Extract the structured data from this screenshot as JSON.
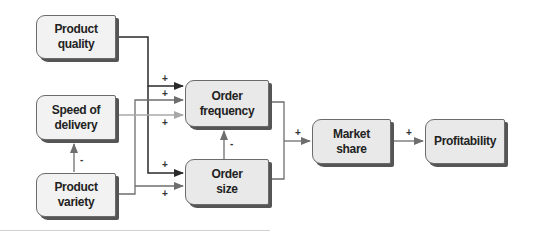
{
  "diagram": {
    "type": "causal-flow",
    "nodes": [
      {
        "id": "product_quality",
        "label": "Product\nquality"
      },
      {
        "id": "speed_of_delivery",
        "label": "Speed of\ndelivery"
      },
      {
        "id": "product_variety",
        "label": "Product\nvariety"
      },
      {
        "id": "order_frequency",
        "label": "Order\nfrequency"
      },
      {
        "id": "order_size",
        "label": "Order\nsize"
      },
      {
        "id": "market_share",
        "label": "Market\nshare"
      },
      {
        "id": "profitability",
        "label": "Profitability"
      }
    ],
    "edges": [
      {
        "from": "product_quality",
        "to": "order_frequency",
        "sign": "+"
      },
      {
        "from": "product_quality",
        "to": "order_size",
        "sign": "+"
      },
      {
        "from": "product_variety",
        "to": "order_frequency",
        "sign": "+"
      },
      {
        "from": "speed_of_delivery",
        "to": "order_frequency",
        "sign": "+"
      },
      {
        "from": "product_variety",
        "to": "order_size",
        "sign": "+"
      },
      {
        "from": "product_variety",
        "to": "speed_of_delivery",
        "sign": "-"
      },
      {
        "from": "order_size",
        "to": "order_frequency",
        "sign": "-"
      },
      {
        "from": "order_frequency",
        "to": "market_share",
        "sign": "+"
      },
      {
        "from": "order_size",
        "to": "market_share",
        "sign": "+"
      },
      {
        "from": "market_share",
        "to": "profitability",
        "sign": "+"
      }
    ],
    "signs": {
      "pq_of": "+",
      "pv_of": "+",
      "sd_of": "+",
      "pq_os": "+",
      "pv_os": "+",
      "pv_sd": "-",
      "os_of": "-",
      "to_ms": "+",
      "ms_pr": "+"
    }
  }
}
